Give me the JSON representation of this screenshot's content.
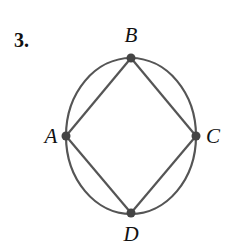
{
  "problem_number": "3.",
  "graph": {
    "vertices": [
      {
        "id": "B",
        "label": "B",
        "x": 131,
        "y": 58,
        "lx": 131,
        "ly": 42
      },
      {
        "id": "A",
        "label": "A",
        "x": 66,
        "y": 136,
        "lx": 51,
        "ly": 143
      },
      {
        "id": "C",
        "label": "C",
        "x": 196,
        "y": 136,
        "lx": 213,
        "ly": 143
      },
      {
        "id": "D",
        "label": "D",
        "x": 131,
        "y": 213,
        "lx": 131,
        "ly": 241
      }
    ],
    "edges": [
      [
        "A",
        "B"
      ],
      [
        "B",
        "C"
      ],
      [
        "C",
        "D"
      ],
      [
        "D",
        "A"
      ]
    ],
    "ellipse": {
      "cx": 131,
      "cy": 136,
      "rx": 65,
      "ry": 78
    },
    "colors": {
      "stroke": "#555555",
      "vertex": "#444444",
      "text": "#111111"
    }
  }
}
